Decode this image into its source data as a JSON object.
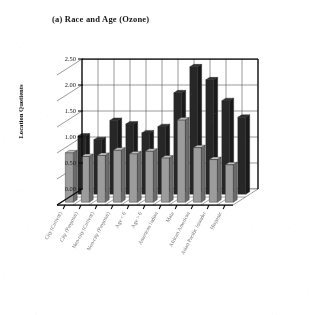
{
  "figure": {
    "title": "(a) Race and Age (Ozone)",
    "ylabel": "Location Quotients"
  },
  "chart_data": {
    "type": "bar",
    "title": "(a) Race and Age (Ozone)",
    "subtitle": "",
    "xlabel": "",
    "ylabel": "Location Quotients",
    "ylim": [
      0.0,
      2.5
    ],
    "yticks": [
      "0.00",
      "0.50",
      "1.00",
      "1.50",
      "2.00",
      "2.50"
    ],
    "ytick_values": [
      0.0,
      0.5,
      1.0,
      1.5,
      2.0,
      2.5
    ],
    "grid": true,
    "legend": "none",
    "projection": "3d-bar",
    "depth_rows": 2,
    "categories": [
      "City (Current)",
      "City (Proposal)",
      "Non-city (Current)",
      "Non-city (Proposal)",
      "Age < 6",
      "Age > 6",
      "American Indian",
      "Male",
      "African American",
      "Asian Pacific Islander",
      "Hispanic"
    ],
    "series": [
      {
        "name": "Front row",
        "color": "#9b9b9b",
        "values": [
          0.95,
          0.88,
          0.9,
          1.0,
          0.93,
          0.98,
          0.85,
          1.58,
          1.05,
          0.82,
          0.72
        ]
      },
      {
        "name": "Back row",
        "color": "#2b2b2b",
        "values": [
          1.12,
          1.05,
          1.42,
          1.35,
          1.18,
          1.3,
          1.95,
          2.45,
          2.2,
          1.8,
          1.48
        ]
      }
    ],
    "annotations": []
  }
}
